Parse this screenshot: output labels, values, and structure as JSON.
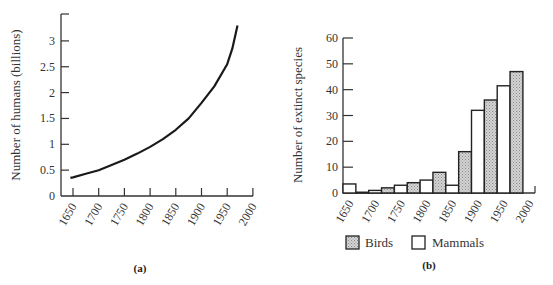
{
  "chart_data": [
    {
      "type": "line",
      "panel_label": "(a)",
      "title": "",
      "xlabel": "",
      "ylabel": "Number of humans (billions)",
      "xlim": [
        1640,
        2000
      ],
      "ylim": [
        0,
        3.5
      ],
      "x_ticks": [
        "1650",
        "1700",
        "1750",
        "1800",
        "1850",
        "1900",
        "1950",
        "2000"
      ],
      "y_ticks": [
        "0",
        "0.5",
        "1",
        "1.5",
        "2",
        "2.5",
        "3"
      ],
      "grid": false,
      "series": [
        {
          "name": "World human population",
          "x": [
            1645,
            1650,
            1675,
            1700,
            1725,
            1750,
            1775,
            1800,
            1825,
            1850,
            1875,
            1900,
            1925,
            1950,
            1960,
            1970
          ],
          "y": [
            0.35,
            0.36,
            0.43,
            0.5,
            0.6,
            0.7,
            0.82,
            0.95,
            1.1,
            1.28,
            1.5,
            1.8,
            2.12,
            2.55,
            2.85,
            3.3
          ]
        }
      ]
    },
    {
      "type": "bar",
      "panel_label": "(b)",
      "title": "",
      "xlabel": "",
      "ylabel": "Number of extinct species",
      "ylim": [
        0,
        60
      ],
      "y_ticks": [
        "0",
        "10",
        "20",
        "30",
        "40",
        "50",
        "60"
      ],
      "x_ticks": [
        "1650",
        "1700",
        "1750",
        "1800",
        "1850",
        "1900",
        "1950",
        "2000"
      ],
      "categories": [
        "1650",
        "1700",
        "1750",
        "1800",
        "1850",
        "1900",
        "1950"
      ],
      "grid": false,
      "legend_position": "bottom",
      "series": [
        {
          "name": "Mammals",
          "color": "#ffffff",
          "values": [
            3.5,
            1,
            3,
            5,
            3,
            32,
            41.5
          ]
        },
        {
          "name": "Birds",
          "color": "#c8c8c8",
          "values": [
            0.3,
            2,
            4,
            8,
            16,
            36,
            47
          ]
        }
      ],
      "legend": [
        "Birds",
        "Mammals"
      ]
    }
  ]
}
